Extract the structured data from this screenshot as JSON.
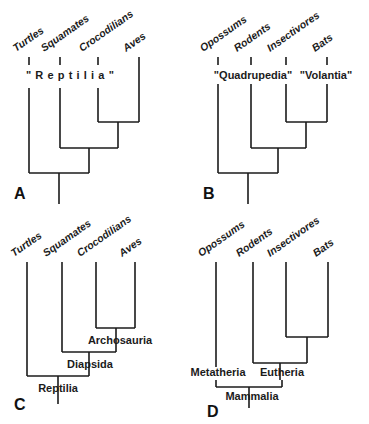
{
  "figure": {
    "background_color": "#ffffff",
    "line_color": "#1b1b1b",
    "width": 369,
    "height": 424
  },
  "panels": [
    {
      "letter": "A",
      "letter_pos": {
        "x": 18,
        "y": 200
      },
      "taxa": [
        {
          "label": "Turtles",
          "x": 29,
          "label_x": 16,
          "label_y": 52
        },
        {
          "label": "Squamates",
          "x": 60,
          "label_x": 44,
          "label_y": 52
        },
        {
          "label": "Crocodilians",
          "x": 98,
          "label_x": 82,
          "label_y": 52
        },
        {
          "label": "Aves",
          "x": 139,
          "label_x": 126,
          "label_y": 52
        }
      ],
      "ticks": [
        {
          "x": 29,
          "y1": 57,
          "y2": 65
        },
        {
          "x": 60,
          "y1": 57,
          "y2": 65
        },
        {
          "x": 98,
          "y1": 57,
          "y2": 65
        },
        {
          "x": 139,
          "y1": 57,
          "y2": 88
        }
      ],
      "clade_labels": [
        {
          "text": "\"Reptilia\"",
          "x": 70,
          "y": 78,
          "spaced": true
        }
      ],
      "tips": [
        {
          "x": 29,
          "y_top": 88
        },
        {
          "x": 60,
          "y_top": 88
        },
        {
          "x": 98,
          "y_top": 88
        }
      ],
      "nodes": [
        {
          "name": "croc-aves",
          "x1": 98,
          "x2": 139,
          "y": 122,
          "stem_x": 118,
          "stem_y": 148
        },
        {
          "name": "squam-croc-aves",
          "x1": 60,
          "x2": 118,
          "y": 148,
          "stem_x": 89,
          "stem_y": 173
        },
        {
          "name": "root-node",
          "x1": 29,
          "x2": 89,
          "y": 173,
          "stem_x": 59,
          "stem_y": 204
        }
      ]
    },
    {
      "letter": "B",
      "letter_pos": {
        "x": 18,
        "y": 200
      },
      "taxa": [
        {
          "label": "Opossums",
          "x": 33,
          "label_x": 18,
          "label_y": 52
        },
        {
          "label": "Rodents",
          "x": 66,
          "label_x": 52,
          "label_y": 52
        },
        {
          "label": "Insectivores",
          "x": 101,
          "label_x": 85,
          "label_y": 52
        },
        {
          "label": "Bats",
          "x": 142,
          "label_x": 130,
          "label_y": 52
        }
      ],
      "ticks": [
        {
          "x": 33,
          "y1": 57,
          "y2": 65
        },
        {
          "x": 66,
          "y1": 57,
          "y2": 65
        },
        {
          "x": 101,
          "y1": 57,
          "y2": 65
        },
        {
          "x": 142,
          "y1": 57,
          "y2": 65
        }
      ],
      "clade_labels": [
        {
          "text": "\"Quadrupedia\"",
          "x": 68,
          "y": 78,
          "spaced": false
        },
        {
          "text": "\"Volantia\"",
          "x": 141,
          "y": 78,
          "spaced": false
        }
      ],
      "tips": [
        {
          "x": 33,
          "y_top": 84
        },
        {
          "x": 66,
          "y_top": 84
        },
        {
          "x": 101,
          "y_top": 84
        },
        {
          "x": 142,
          "y_top": 84
        }
      ],
      "nodes": [
        {
          "name": "insect-bats",
          "x1": 101,
          "x2": 142,
          "y": 122,
          "stem_x": 121,
          "stem_y": 148
        },
        {
          "name": "rodents-insect-bats",
          "x1": 66,
          "x2": 121,
          "y": 148,
          "stem_x": 93,
          "stem_y": 173
        },
        {
          "name": "root-node",
          "x1": 33,
          "x2": 93,
          "y": 173,
          "stem_x": 63,
          "stem_y": 204
        }
      ]
    },
    {
      "letter": "C",
      "letter_pos": {
        "x": 18,
        "y": 196
      },
      "taxa": [
        {
          "label": "Turtles",
          "x": 27,
          "label_x": 14,
          "label_y": 42
        },
        {
          "label": "Squamates",
          "x": 62,
          "label_x": 46,
          "label_y": 42
        },
        {
          "label": "Crocodilians",
          "x": 96,
          "label_x": 80,
          "label_y": 42
        },
        {
          "label": "Aves",
          "x": 135,
          "label_x": 122,
          "label_y": 42
        }
      ],
      "ticks": [],
      "tips": [
        {
          "x": 27,
          "y_top": 48
        },
        {
          "x": 62,
          "y_top": 48
        },
        {
          "x": 96,
          "y_top": 48
        },
        {
          "x": 135,
          "y_top": 48
        }
      ],
      "nodes": [
        {
          "name": "archosauria",
          "x1": 96,
          "x2": 135,
          "y": 116,
          "stem_x": 116,
          "stem_y": 140,
          "label": "Archosauria",
          "label_x": 120,
          "label_y": 132
        },
        {
          "name": "diapsida",
          "x1": 62,
          "x2": 116,
          "y": 140,
          "stem_x": 89,
          "stem_y": 164,
          "label": "Diapsida",
          "label_x": 90,
          "label_y": 156
        },
        {
          "name": "reptilia",
          "x1": 27,
          "x2": 89,
          "y": 164,
          "stem_x": 58,
          "stem_y": 190,
          "label": "Reptilia",
          "label_x": 58,
          "label_y": 180
        }
      ],
      "clade_labels": []
    },
    {
      "letter": "D",
      "letter_pos": {
        "x": 22,
        "y": 200
      },
      "taxa": [
        {
          "label": "Opossums",
          "x": 31,
          "label_x": 18,
          "label_y": 42
        },
        {
          "label": "Rodents",
          "x": 68,
          "label_x": 54,
          "label_y": 42
        },
        {
          "label": "Insectivores",
          "x": 101,
          "label_x": 85,
          "label_y": 42
        },
        {
          "label": "Bats",
          "x": 143,
          "label_x": 131,
          "label_y": 42
        }
      ],
      "ticks": [],
      "tips": [
        {
          "x": 31,
          "y_top": 48
        },
        {
          "x": 68,
          "y_top": 48
        },
        {
          "x": 101,
          "y_top": 48
        },
        {
          "x": 143,
          "y_top": 48
        }
      ],
      "nodes": [
        {
          "name": "insect-bats",
          "x1": 101,
          "x2": 143,
          "y": 125,
          "stem_x": 122,
          "stem_y": 151
        },
        {
          "name": "eutheria",
          "x1": 68,
          "x2": 122,
          "y": 151,
          "stem_x": 95,
          "stem_y": 168,
          "label": "Eutheria",
          "label_x": 97,
          "label_y": 163
        },
        {
          "name": "mammalia",
          "x1": 31,
          "x2": 97,
          "y": 168,
          "stem_x": 64,
          "stem_y": 195,
          "label": "Mammalia",
          "label_x": 67,
          "label_y": 182
        }
      ],
      "clade_labels": [
        {
          "text": "Metatheria",
          "x": 31,
          "y": 163,
          "spaced": false
        }
      ]
    }
  ],
  "legend": {
    "panel_a_caption": "A",
    "panel_b_caption": "B",
    "panel_c_caption": "C",
    "panel_d_caption": "D"
  }
}
